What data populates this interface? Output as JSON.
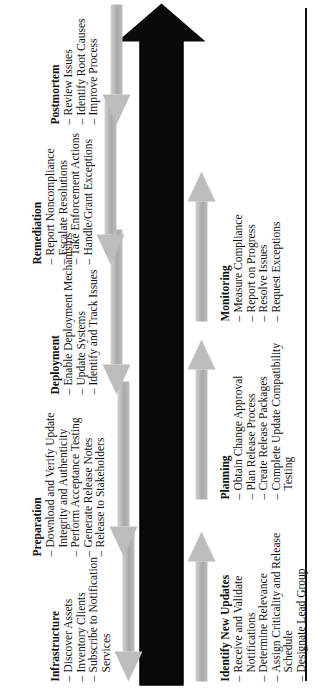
{
  "figure": {
    "name": "patch-management-timeline",
    "orientation": "rotated-landscape",
    "colors": {
      "timeline": "#0a0a0a",
      "phase_arrow": "#bdbdbd",
      "tick": "#ffffff",
      "text": "#111111"
    }
  },
  "timeline": {
    "day_labels": [
      {
        "label": "Day 1"
      },
      {
        "label": "Days 2–4"
      },
      {
        "label": "Days 5–7"
      },
      {
        "label": "Days 8–12"
      }
    ]
  },
  "phases_below": [
    {
      "title": "Identify New Updates",
      "items": [
        "Receive and Validate Notifications",
        "Determine Relevance",
        "Assign Criticality and Release Schedule",
        "Designate Lead Group"
      ]
    },
    {
      "title": "Planning",
      "items": [
        "Obtain Change Approval",
        "Plan Release Process",
        "Create Release Packages",
        "Complete Update Compatibility Testing"
      ]
    },
    {
      "title": "Monitoring",
      "items": [
        "Measure Compliance",
        "Report on Progress",
        "Resolve Issues",
        "Request Exceptions"
      ]
    }
  ],
  "phases_above": [
    {
      "title": "Infrastructure",
      "items": [
        "Discover Assets",
        "Inventory Clients",
        "Subscribe to Notification Services"
      ]
    },
    {
      "title": "Preparation",
      "items": [
        "Download and Verify Update Integrity and Authenticity",
        "Perform Acceptance Testing",
        "Generate Release Notes",
        "Release to Stakeholders"
      ]
    },
    {
      "title": "Deployment",
      "items": [
        "Enable Deployment Mechanisms",
        "Update Systems",
        "Identify and Track Issues"
      ]
    },
    {
      "title": "Remediation",
      "items": [
        "Report Noncompliance",
        "Escalate Resolutions",
        "Take Enforcement Actions",
        "Handle/Grant Exceptions"
      ]
    },
    {
      "title": "Postmortem",
      "items": [
        "Review Issues",
        "Identify Root Causes",
        "Improve Process"
      ]
    }
  ]
}
